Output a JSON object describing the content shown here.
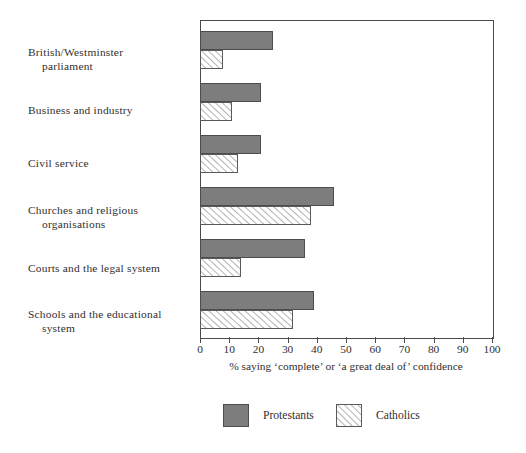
{
  "chart_data": {
    "type": "bar",
    "orientation": "horizontal",
    "title": "",
    "subtitle": "",
    "xlabel": "% saying ‘complete’ or ‘a great deal of’ confidence",
    "ylabel": "",
    "xlim": [
      0,
      100
    ],
    "grid": false,
    "legend_position": "bottom",
    "categories": [
      "British/Westminster parliament",
      "Business and industry",
      "Civil service",
      "Churches and religious organisations",
      "Courts and the legal system",
      "Schools and the educational system"
    ],
    "category_lines": [
      [
        "British/Westminster",
        "parliament"
      ],
      [
        "Business and industry",
        ""
      ],
      [
        "Civil service",
        ""
      ],
      [
        "Churches and religious",
        "organisations"
      ],
      [
        "Courts and the legal system",
        ""
      ],
      [
        "Schools and the educational",
        "system"
      ]
    ],
    "series": [
      {
        "name": "Protestants",
        "fill": "solid",
        "color": "#7d7d7d",
        "values": [
          25,
          21,
          21,
          46,
          36,
          39
        ]
      },
      {
        "name": "Catholics",
        "fill": "hatched",
        "color": "#ffffff",
        "values": [
          8,
          11,
          13,
          38,
          14,
          32
        ]
      }
    ],
    "x_ticks": [
      0,
      10,
      20,
      30,
      40,
      50,
      60,
      70,
      80,
      90,
      100
    ],
    "x_tick_labels": [
      "0",
      "10",
      "20",
      "30",
      "40",
      "50",
      "60",
      "70",
      "80",
      "90",
      "100"
    ]
  },
  "legend": {
    "items": [
      {
        "label": "Protestants",
        "swatch": "solid-gray-swatch"
      },
      {
        "label": "Catholics",
        "swatch": "hatched-swatch"
      }
    ]
  },
  "axis": {
    "title": "% saying ‘complete’ or ‘a great deal of’ confidence"
  },
  "colors": {
    "protestant_fill": "#7d7d7d",
    "catholic_fill": "#ffffff",
    "hatch_line": "#6a6a6a",
    "frame": "#4a4a4a",
    "text": "#2f2f2f",
    "background": "#ffffff"
  }
}
